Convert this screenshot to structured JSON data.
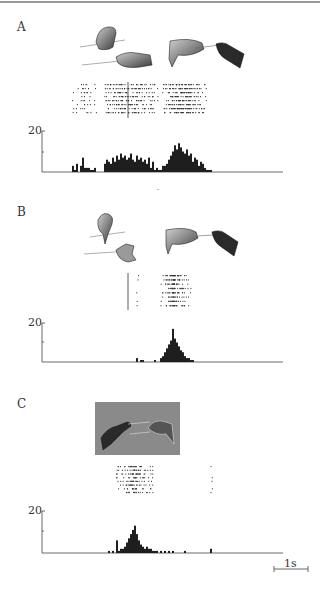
{
  "figure": {
    "panels": [
      {
        "id": "A",
        "label": "A",
        "ytick_max_label": "20",
        "illustrations": [
          "hand-grasping-object-from-hand",
          "hand-receiving-object"
        ],
        "raster": {
          "trials": 8,
          "event_line_x": 128
        }
      },
      {
        "id": "B",
        "label": "B",
        "ytick_max_label": "20",
        "illustrations": [
          "hand-with-tool-pointing",
          "hand-receiving-object"
        ],
        "raster": {
          "trials": 8,
          "event_line_x": 128
        }
      },
      {
        "id": "C",
        "label": "C",
        "ytick_max_label": "20",
        "illustrations": [
          "hands-on-gray-background"
        ],
        "raster": {
          "trials": 8
        }
      }
    ],
    "scale_bar": {
      "label": "1s",
      "duration": "1 s"
    }
  },
  "chart_data": [
    {
      "type": "bar",
      "title": "Panel A peri-event histogram",
      "xlabel": "time (scale bar 1 s)",
      "ylabel": "spikes/bin",
      "ylim": [
        0,
        20
      ],
      "yticks": [
        10,
        20
      ],
      "ytick_labels": [
        "",
        "20"
      ],
      "grid": false,
      "bins_x_px": [
        72,
        74,
        76,
        78,
        80,
        82,
        84,
        86,
        88,
        90,
        92,
        94,
        104,
        106,
        108,
        110,
        112,
        114,
        116,
        118,
        120,
        122,
        124,
        126,
        128,
        130,
        132,
        134,
        136,
        138,
        140,
        142,
        144,
        146,
        148,
        150,
        152,
        154,
        156,
        158,
        160,
        162,
        164,
        166,
        168,
        170,
        172,
        174,
        176,
        178,
        180,
        182,
        184,
        186,
        188,
        190,
        192,
        194,
        196,
        198,
        200,
        202,
        204,
        206,
        208,
        210
      ],
      "values": [
        3,
        1,
        4,
        0,
        3,
        7,
        2,
        2,
        2,
        1,
        1,
        2,
        4,
        6,
        5,
        4,
        7,
        5,
        8,
        6,
        9,
        7,
        8,
        6,
        7,
        9,
        6,
        5,
        8,
        6,
        7,
        5,
        6,
        4,
        7,
        2,
        5,
        1,
        2,
        1,
        1,
        3,
        3,
        4,
        6,
        8,
        10,
        13,
        11,
        14,
        12,
        10,
        9,
        11,
        8,
        9,
        5,
        7,
        6,
        3,
        5,
        4,
        2,
        1,
        1,
        1
      ]
    },
    {
      "type": "bar",
      "title": "Panel B peri-event histogram",
      "xlabel": "time (scale bar 1 s)",
      "ylabel": "spikes/bin",
      "ylim": [
        0,
        20
      ],
      "yticks": [
        10,
        20
      ],
      "ytick_labels": [
        "",
        "20"
      ],
      "grid": false,
      "bins_x_px": [
        136,
        140,
        142,
        154,
        160,
        162,
        164,
        166,
        168,
        170,
        172,
        172,
        174,
        176,
        178,
        180,
        182,
        184,
        186,
        188,
        190,
        192
      ],
      "values": [
        2,
        1,
        1,
        1,
        2,
        3,
        5,
        7,
        9,
        11,
        13,
        17,
        12,
        10,
        8,
        6,
        5,
        3,
        2,
        2,
        1,
        1
      ]
    },
    {
      "type": "bar",
      "title": "Panel C peri-event histogram",
      "xlabel": "time (scale bar 1 s)",
      "ylabel": "spikes/bin",
      "ylim": [
        0,
        20
      ],
      "yticks": [
        10,
        20
      ],
      "ytick_labels": [
        "",
        "20"
      ],
      "grid": false,
      "bins_x_px": [
        108,
        112,
        116,
        118,
        120,
        122,
        124,
        126,
        128,
        130,
        132,
        134,
        136,
        138,
        140,
        142,
        144,
        146,
        148,
        150,
        152,
        154,
        156,
        160,
        164,
        168,
        172,
        184,
        210
      ],
      "values": [
        1,
        1,
        6,
        1,
        2,
        2,
        3,
        5,
        7,
        9,
        11,
        13,
        9,
        6,
        4,
        3,
        2,
        3,
        2,
        2,
        1,
        1,
        1,
        1,
        1,
        1,
        1,
        1,
        2
      ]
    }
  ]
}
